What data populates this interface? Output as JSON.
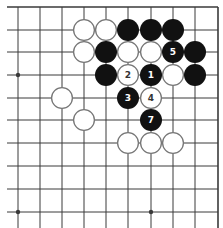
{
  "board": {
    "description": "Go board, top-right corner region, move sequence diagram",
    "colors": {
      "background": "#ffffff",
      "grid_line": "#3a3a3a",
      "black_stone": "#111111",
      "white_stone_fill": "#ffffff",
      "white_stone_outline": "#777777",
      "label_on_black": "#ffffff",
      "label_on_white": "#333333"
    },
    "grid": {
      "columns_x": [
        18,
        40,
        62,
        84,
        106,
        128,
        151,
        173,
        195,
        218
      ],
      "rows_y": [
        7,
        30,
        52,
        75,
        98,
        120,
        143,
        166,
        189,
        212
      ],
      "top_edge_is_border": true,
      "right_edge_is_border": true,
      "line_extent": {
        "left": 7,
        "bottom": 228
      }
    },
    "star_points": [
      {
        "col": 0,
        "row": 3
      },
      {
        "col": 0,
        "row": 9
      },
      {
        "col": 6,
        "row": 9
      }
    ],
    "stone_radius": 11,
    "stones": [
      {
        "color": "white",
        "col": 3,
        "row": 1,
        "label": ""
      },
      {
        "color": "white",
        "col": 4,
        "row": 1,
        "label": ""
      },
      {
        "color": "black",
        "col": 5,
        "row": 1,
        "label": ""
      },
      {
        "color": "black",
        "col": 6,
        "row": 1,
        "label": ""
      },
      {
        "color": "black",
        "col": 7,
        "row": 1,
        "label": ""
      },
      {
        "color": "white",
        "col": 3,
        "row": 2,
        "label": ""
      },
      {
        "color": "black",
        "col": 4,
        "row": 2,
        "label": ""
      },
      {
        "color": "white",
        "col": 5,
        "row": 2,
        "label": ""
      },
      {
        "color": "white",
        "col": 6,
        "row": 2,
        "label": ""
      },
      {
        "color": "black",
        "col": 7,
        "row": 2,
        "label": "5"
      },
      {
        "color": "black",
        "col": 8,
        "row": 2,
        "label": ""
      },
      {
        "color": "black",
        "col": 4,
        "row": 3,
        "label": ""
      },
      {
        "color": "white",
        "col": 5,
        "row": 3,
        "label": "2"
      },
      {
        "color": "black",
        "col": 6,
        "row": 3,
        "label": "1"
      },
      {
        "color": "white",
        "col": 7,
        "row": 3,
        "label": ""
      },
      {
        "color": "black",
        "col": 8,
        "row": 3,
        "label": ""
      },
      {
        "color": "white",
        "col": 2,
        "row": 4,
        "label": ""
      },
      {
        "color": "black",
        "col": 5,
        "row": 4,
        "label": "3"
      },
      {
        "color": "white",
        "col": 6,
        "row": 4,
        "label": "4"
      },
      {
        "color": "white",
        "col": 3,
        "row": 5,
        "label": ""
      },
      {
        "color": "black",
        "col": 6,
        "row": 5,
        "label": "7"
      },
      {
        "color": "white",
        "col": 5,
        "row": 6,
        "label": ""
      },
      {
        "color": "white",
        "col": 6,
        "row": 6,
        "label": ""
      },
      {
        "color": "white",
        "col": 7,
        "row": 6,
        "label": ""
      }
    ]
  }
}
